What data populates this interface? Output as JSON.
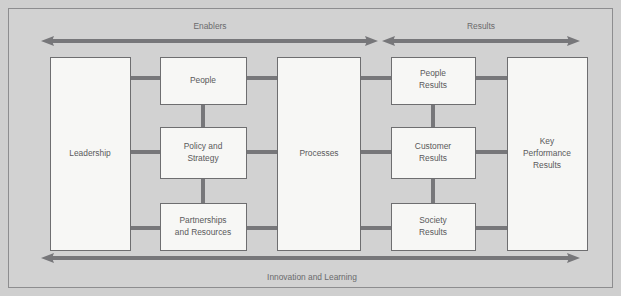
{
  "figure": {
    "name": "EFQM Excellence Model",
    "background_color": "#cfcfcf",
    "frame_color": "#8d8d8f",
    "box_fill": "#f7f7f5",
    "box_border": "#6e6e70",
    "connector_color": "#77777a",
    "arrow_color": "#77777a",
    "text_color": "#59595b"
  },
  "bands": {
    "top_left": {
      "label": "Enablers"
    },
    "top_right": {
      "label": "Results"
    },
    "bottom": {
      "label": "Innovation and Learning"
    }
  },
  "boxes": {
    "leadership": {
      "label": "Leadership",
      "lines": [
        "Leadership"
      ]
    },
    "people": {
      "label": "People",
      "lines": [
        "People"
      ]
    },
    "policy_and_strategy": {
      "label": "Policy and Strategy",
      "lines": [
        "Policy and",
        "Strategy"
      ]
    },
    "partnerships_and_resources": {
      "label": "Partnerships and Resources",
      "lines": [
        "Partnerships",
        "and Resources"
      ]
    },
    "processes": {
      "label": "Processes",
      "lines": [
        "Processes"
      ]
    },
    "people_results": {
      "label": "People Results",
      "lines": [
        "People",
        "Results"
      ]
    },
    "customer_results": {
      "label": "Customer Results",
      "lines": [
        "Customer",
        "Results"
      ]
    },
    "society_results": {
      "label": "Society Results",
      "lines": [
        "Society",
        "Results"
      ]
    },
    "key_performance_results": {
      "label": "Key Performance Results",
      "lines": [
        "Key",
        "Performance",
        "Results"
      ]
    }
  },
  "icons": {
    "arrow_left_head": "arrow-left-icon",
    "arrow_right_head": "arrow-right-icon"
  }
}
